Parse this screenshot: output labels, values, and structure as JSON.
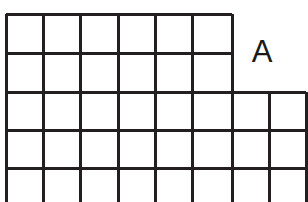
{
  "figure": {
    "type": "grid-polyomino-diagram",
    "title": "",
    "background_color": "#ffffff",
    "line_color": "#231f20",
    "line_width_px": 3,
    "canvas": {
      "width": 308,
      "height": 202
    }
  },
  "grid": {
    "cell_width_px": 37,
    "cell_height_px": 38.5,
    "origin": {
      "x": 6,
      "y": 14
    },
    "column_line_positions": [
      6,
      43,
      80,
      118,
      155,
      192,
      232,
      269,
      306
    ],
    "row_line_positions": [
      14,
      53,
      92,
      130,
      168,
      202
    ],
    "column_count": 8,
    "row_count": 5,
    "rows": [
      {
        "index": 1,
        "top": 14,
        "bottom": 53,
        "left": 6,
        "right": 232,
        "cells": 6
      },
      {
        "index": 2,
        "top": 53,
        "bottom": 92,
        "left": 6,
        "right": 232,
        "cells": 6
      },
      {
        "index": 3,
        "top": 92,
        "bottom": 130,
        "left": 6,
        "right": 306,
        "cells": 8
      },
      {
        "index": 4,
        "top": 130,
        "bottom": 168,
        "left": 6,
        "right": 306,
        "cells": 8
      },
      {
        "index": 5,
        "top": 168,
        "bottom": 202,
        "left": 6,
        "right": 306,
        "cells": 8
      }
    ],
    "total_cells_visible": 36,
    "shape_description": "step-shaped grid: upper block 6 columns wide, lower block 8 columns wide"
  },
  "segments": {
    "horizontal": [
      {
        "name": "top-edge",
        "y": 14,
        "x1": 6,
        "x2": 232
      },
      {
        "name": "row1-row2-divider",
        "y": 53,
        "x1": 6,
        "x2": 232
      },
      {
        "name": "step-edge",
        "y": 92,
        "x1": 6,
        "x2": 306
      },
      {
        "name": "row3-row4-divider",
        "y": 130,
        "x1": 6,
        "x2": 306
      },
      {
        "name": "row4-row5-divider",
        "y": 168,
        "x1": 6,
        "x2": 306
      }
    ],
    "vertical": [
      {
        "name": "left-edge",
        "x": 6,
        "y1": 14,
        "y2": 202
      },
      {
        "name": "col-divider-1",
        "x": 43,
        "y1": 14,
        "y2": 202
      },
      {
        "name": "col-divider-2",
        "x": 80,
        "y1": 14,
        "y2": 202
      },
      {
        "name": "col-divider-3",
        "x": 118,
        "y1": 14,
        "y2": 202
      },
      {
        "name": "col-divider-4",
        "x": 155,
        "y1": 14,
        "y2": 202
      },
      {
        "name": "col-divider-5",
        "x": 192,
        "y1": 14,
        "y2": 202
      },
      {
        "name": "step-right-edge-upper",
        "x": 232,
        "y1": 14,
        "y2": 202
      },
      {
        "name": "col-divider-7",
        "x": 269,
        "y1": 92,
        "y2": 202
      },
      {
        "name": "right-edge-lower",
        "x": 306,
        "y1": 92,
        "y2": 202
      }
    ]
  },
  "labels": {
    "region_a": {
      "text": "A",
      "x": 262,
      "y": 52,
      "font_size_px": 31,
      "color": "#1a1a1a"
    }
  }
}
